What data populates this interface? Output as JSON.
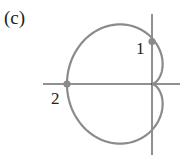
{
  "figure": {
    "panel_label": "(c)",
    "curve": {
      "type": "cardioid",
      "equation_form": "r = a(1 - cos θ)",
      "color": "#8a8a8a",
      "cusp": "origin"
    },
    "axes": {
      "color": "#222222"
    },
    "points": [
      {
        "label": "1",
        "location": "positive y-axis intersection",
        "color": "#8a8a8a"
      },
      {
        "label": "2",
        "location": "negative x-axis intersection",
        "color": "#8a8a8a"
      }
    ]
  }
}
